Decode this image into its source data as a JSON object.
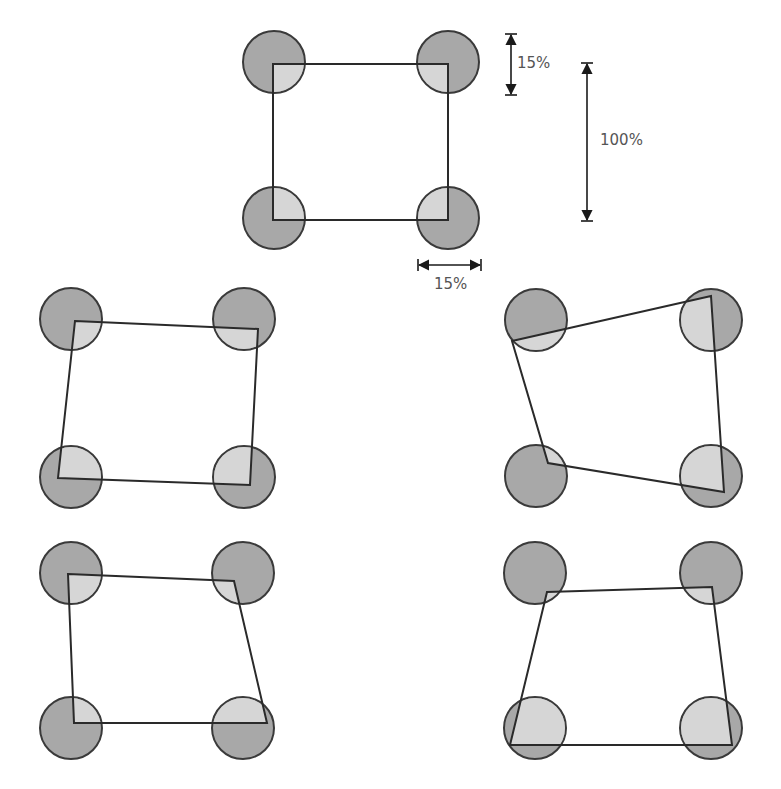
{
  "diagram": {
    "title": "",
    "colors": {
      "circle_dark": "#a8a8a8",
      "circle_light": "#d6d6d6",
      "outline": "#2a2a2a",
      "label": "#555555"
    },
    "circle_radius": 31,
    "reference": {
      "circles": [
        [
          274,
          62
        ],
        [
          448,
          62
        ],
        [
          274,
          218
        ],
        [
          448,
          218
        ]
      ],
      "quad": [
        [
          273,
          64
        ],
        [
          448,
          64
        ],
        [
          448,
          220
        ],
        [
          273,
          220
        ]
      ],
      "dimensions": {
        "corner_vertical": {
          "label": "15%",
          "x": 511,
          "y1": 34,
          "y2": 95
        },
        "side_vertical": {
          "label": "100%",
          "x": 587,
          "y1": 63,
          "y2": 221
        },
        "corner_horizontal": {
          "label": "15%",
          "y": 265,
          "x1": 418,
          "x2": 481
        }
      }
    },
    "panels": [
      {
        "name": "mid-left",
        "circles": [
          [
            71,
            319
          ],
          [
            244,
            319
          ],
          [
            71,
            477
          ],
          [
            244,
            477
          ]
        ],
        "quad": [
          [
            75,
            321
          ],
          [
            258,
            329
          ],
          [
            250,
            485
          ],
          [
            58,
            478
          ]
        ]
      },
      {
        "name": "mid-right",
        "circles": [
          [
            536,
            320
          ],
          [
            711,
            320
          ],
          [
            536,
            476
          ],
          [
            711,
            476
          ]
        ],
        "quad": [
          [
            512,
            341
          ],
          [
            711,
            296
          ],
          [
            724,
            492
          ],
          [
            548,
            463
          ]
        ]
      },
      {
        "name": "bottom-left",
        "circles": [
          [
            71,
            573
          ],
          [
            243,
            573
          ],
          [
            71,
            728
          ],
          [
            243,
            728
          ]
        ],
        "quad": [
          [
            68,
            574
          ],
          [
            234,
            581
          ],
          [
            267,
            723
          ],
          [
            74,
            723
          ]
        ]
      },
      {
        "name": "bottom-right",
        "circles": [
          [
            535,
            573
          ],
          [
            711,
            573
          ],
          [
            535,
            728
          ],
          [
            711,
            728
          ]
        ],
        "quad": [
          [
            547,
            592
          ],
          [
            712,
            587
          ],
          [
            732,
            745
          ],
          [
            510,
            745
          ]
        ]
      }
    ],
    "labels": {
      "corner_v": "15%",
      "side_v": "100%",
      "corner_h": "15%"
    }
  }
}
